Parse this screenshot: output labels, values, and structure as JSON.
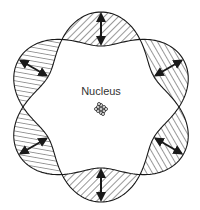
{
  "diagram": {
    "center_label": "Nucleus",
    "lobe_count": 6,
    "stroke_color": "#1a1a1a",
    "background": "#ffffff",
    "geometry": {
      "cx": 101,
      "cy": 107,
      "r0": 78,
      "amplitude": 17,
      "nucleus_radius": 6
    },
    "lobes": [
      {
        "angle_deg": 90,
        "hatch": "diagonal"
      },
      {
        "angle_deg": 30,
        "hatch": "diagonal"
      },
      {
        "angle_deg": -30,
        "hatch": "diagonal"
      },
      {
        "angle_deg": -90,
        "hatch": "diagonal"
      },
      {
        "angle_deg": -150,
        "hatch": "horizontal"
      },
      {
        "angle_deg": 150,
        "hatch": "horizontal"
      }
    ]
  }
}
